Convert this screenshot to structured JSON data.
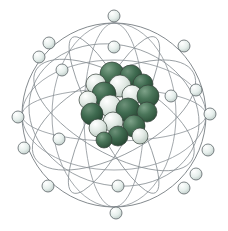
{
  "figure": {
    "title": "Atom model",
    "subject": "atom",
    "background_color": "#ffffff",
    "width": 228,
    "height": 231,
    "style": "3d-rendered-illustration"
  },
  "palette": {
    "background": "#ffffff",
    "orbit_line": "#6e757a",
    "orbit_line_faint": "#858c91",
    "electron_fill_light": "#eef3f1",
    "electron_fill_mid": "#c9d6d2",
    "electron_outline": "#5d6468",
    "proton_green_dark": "#2f5a41",
    "proton_green_mid": "#3f6b50",
    "proton_green_light": "#557f63",
    "neutron_white": "#e6ece8",
    "neutron_white_shade": "#c2cfc7",
    "nucleon_outline": "#35403a"
  },
  "nucleus": {
    "label": "nucleus",
    "center_x": 119,
    "center_y": 106,
    "radius": 40,
    "particle_count": 38,
    "particles": [
      {
        "name": "proton",
        "cx": 112,
        "cy": 74,
        "r": 12,
        "color": "#3f6b50"
      },
      {
        "name": "proton",
        "cx": 131,
        "cy": 76,
        "r": 11,
        "color": "#355f46"
      },
      {
        "name": "neutron",
        "cx": 96,
        "cy": 84,
        "r": 10,
        "color": "#dce5df"
      },
      {
        "name": "neutron",
        "cx": 120,
        "cy": 86,
        "r": 11,
        "color": "#e3eae5"
      },
      {
        "name": "proton",
        "cx": 143,
        "cy": 84,
        "r": 10,
        "color": "#3a6449"
      },
      {
        "name": "proton",
        "cx": 104,
        "cy": 94,
        "r": 12,
        "color": "#2f5a41"
      },
      {
        "name": "neutron",
        "cx": 132,
        "cy": 95,
        "r": 10,
        "color": "#d8e2dc"
      },
      {
        "name": "proton",
        "cx": 148,
        "cy": 96,
        "r": 11,
        "color": "#456f54"
      },
      {
        "name": "neutron",
        "cx": 88,
        "cy": 100,
        "r": 9,
        "color": "#cdd9d3"
      },
      {
        "name": "neutron",
        "cx": 110,
        "cy": 106,
        "r": 11,
        "color": "#e8efea"
      },
      {
        "name": "proton",
        "cx": 128,
        "cy": 110,
        "r": 12,
        "color": "#2f5a41"
      },
      {
        "name": "proton",
        "cx": 147,
        "cy": 112,
        "r": 10,
        "color": "#3f6b50"
      },
      {
        "name": "proton",
        "cx": 92,
        "cy": 114,
        "r": 11,
        "color": "#355f46"
      },
      {
        "name": "neutron",
        "cx": 113,
        "cy": 122,
        "r": 10,
        "color": "#dde6e0"
      },
      {
        "name": "proton",
        "cx": 134,
        "cy": 126,
        "r": 11,
        "color": "#3a6449"
      },
      {
        "name": "neutron",
        "cx": 98,
        "cy": 128,
        "r": 9,
        "color": "#d3ded7"
      },
      {
        "name": "proton",
        "cx": 118,
        "cy": 136,
        "r": 10,
        "color": "#2f5a41"
      },
      {
        "name": "neutron",
        "cx": 140,
        "cy": 136,
        "r": 8,
        "color": "#cfdbd4"
      },
      {
        "name": "proton",
        "cx": 104,
        "cy": 140,
        "r": 8,
        "color": "#456f54"
      }
    ]
  },
  "orbits": {
    "label": "electron-orbits",
    "count": 8,
    "shells_described": "intersecting elliptical electron shells forming a sphere",
    "ellipses": [
      {
        "name": "orbit-outer-circle",
        "rx": 92,
        "ry": 92,
        "rotate": 0
      },
      {
        "name": "orbit-vertical-narrow",
        "rx": 30,
        "ry": 92,
        "rotate": 0
      },
      {
        "name": "orbit-vertical-wide",
        "rx": 62,
        "ry": 92,
        "rotate": 0
      },
      {
        "name": "orbit-horizontal-narrow",
        "rx": 92,
        "ry": 26,
        "rotate": 0
      },
      {
        "name": "orbit-horizontal-wide",
        "rx": 92,
        "ry": 55,
        "rotate": 0
      },
      {
        "name": "orbit-tilt-left",
        "rx": 90,
        "ry": 40,
        "rotate": -28
      },
      {
        "name": "orbit-tilt-right",
        "rx": 90,
        "ry": 38,
        "rotate": 30
      },
      {
        "name": "orbit-tilt-steep",
        "rx": 88,
        "ry": 20,
        "rotate": 62
      }
    ]
  },
  "electrons": {
    "label": "electrons",
    "count": 18,
    "radius": 6,
    "positions": [
      {
        "name": "electron-top",
        "cx": 114,
        "cy": 16
      },
      {
        "name": "electron-upper-left-1",
        "cx": 49,
        "cy": 43
      },
      {
        "name": "electron-upper-left-2",
        "cx": 39,
        "cy": 57
      },
      {
        "name": "electron-upper-mid",
        "cx": 114,
        "cy": 47
      },
      {
        "name": "electron-upper-right-1",
        "cx": 184,
        "cy": 46
      },
      {
        "name": "electron-right-upper",
        "cx": 171,
        "cy": 96
      },
      {
        "name": "electron-right-edge",
        "cx": 210,
        "cy": 114
      },
      {
        "name": "electron-right-mid",
        "cx": 196,
        "cy": 90
      },
      {
        "name": "electron-left-edge",
        "cx": 18,
        "cy": 117
      },
      {
        "name": "electron-left-mid",
        "cx": 24,
        "cy": 148
      },
      {
        "name": "electron-left-inner",
        "cx": 59,
        "cy": 139
      },
      {
        "name": "electron-lower-left-1",
        "cx": 48,
        "cy": 186
      },
      {
        "name": "electron-bottom",
        "cx": 116,
        "cy": 213
      },
      {
        "name": "electron-bottom-inner",
        "cx": 118,
        "cy": 186
      },
      {
        "name": "electron-lower-right-1",
        "cx": 196,
        "cy": 174
      },
      {
        "name": "electron-lower-right-2",
        "cx": 184,
        "cy": 188
      },
      {
        "name": "electron-right-low",
        "cx": 208,
        "cy": 150
      },
      {
        "name": "electron-upper-left-3",
        "cx": 62,
        "cy": 70
      }
    ]
  }
}
